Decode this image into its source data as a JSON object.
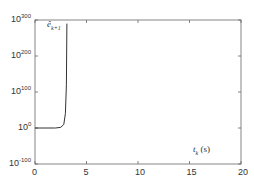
{
  "chart_data": {
    "type": "line",
    "title": "",
    "xlabel": "t_k (s)",
    "ylabel": "",
    "yscale": "log",
    "xlim": [
      0,
      20
    ],
    "ylim_exponent": [
      -100,
      300
    ],
    "x_ticks": [
      "0",
      "5",
      "10",
      "15",
      "20"
    ],
    "y_ticks": [
      {
        "base": "10",
        "exp": "-100"
      },
      {
        "base": "10",
        "exp": "0"
      },
      {
        "base": "10",
        "exp": "100"
      },
      {
        "base": "10",
        "exp": "200"
      },
      {
        "base": "10",
        "exp": "300"
      }
    ],
    "grid": false,
    "legend": null,
    "annotations": [
      {
        "text": "ê",
        "sub": "k+1",
        "position": "top-left near curve"
      },
      {
        "text": "t",
        "sub": "k",
        "suffix": " (s)",
        "position": "lower right"
      }
    ],
    "series": [
      {
        "name": "ê_{k+1}",
        "color": "#333333",
        "points_log10": [
          {
            "x": 0.0,
            "y": 0
          },
          {
            "x": 2.0,
            "y": 0
          },
          {
            "x": 2.5,
            "y": 2
          },
          {
            "x": 2.8,
            "y": 10
          },
          {
            "x": 2.95,
            "y": 40
          },
          {
            "x": 3.05,
            "y": 120
          },
          {
            "x": 3.1,
            "y": 290
          }
        ]
      }
    ]
  }
}
